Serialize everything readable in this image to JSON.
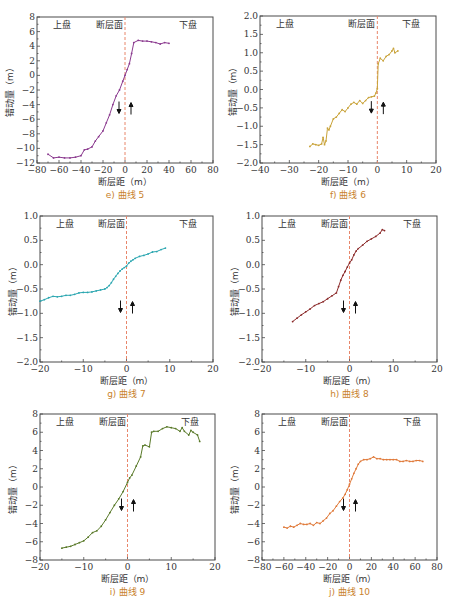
{
  "figure": {
    "x_axis_label": "断层距（m）",
    "y_axis_label": "错动量（m）",
    "region_labels": {
      "hanging_wall": "上盘",
      "fault_plane": "断层面",
      "footwall": "下盘"
    }
  },
  "chart_data": [
    {
      "id": "e",
      "type": "line",
      "title": "e) 曲线 5",
      "caption": "e) 曲线 5",
      "xlabel": "断层距（m）",
      "ylabel": "错动量（m）",
      "xlim": [
        -80,
        80
      ],
      "ylim": [
        -12,
        8
      ],
      "xticks": [
        -80,
        -60,
        -40,
        -20,
        0,
        20,
        40,
        60,
        80
      ],
      "yticks": [
        -12,
        -10,
        -8,
        -6,
        -4,
        -2,
        0,
        2,
        4,
        6,
        8
      ],
      "color": "#8b3a8f",
      "fault_line_x": 0,
      "series": [
        {
          "name": "曲线 5",
          "x": [
            -70,
            -65,
            -60,
            -55,
            -50,
            -45,
            -40,
            -37,
            -34,
            -30,
            -27,
            -24,
            -20,
            -17,
            -14,
            -11,
            -8,
            -5,
            -2,
            0,
            2,
            4,
            6,
            8,
            12,
            16,
            20,
            24,
            28,
            32,
            36,
            40
          ],
          "y": [
            -10.8,
            -11.3,
            -11.2,
            -11.3,
            -11.3,
            -11.2,
            -11.0,
            -10.2,
            -10.1,
            -9.8,
            -9.0,
            -8.4,
            -7.6,
            -6.5,
            -5.4,
            -4.0,
            -2.8,
            -2.0,
            -0.8,
            0.0,
            0.8,
            1.6,
            3.0,
            4.5,
            4.8,
            4.7,
            4.7,
            4.6,
            4.5,
            4.3,
            4.5,
            4.4
          ]
        }
      ]
    },
    {
      "id": "f",
      "type": "line",
      "title": "f) 曲线 6",
      "caption": "f) 曲线 6",
      "xlabel": "断层距（m）",
      "ylabel": "错动量（m）",
      "xlim": [
        -40,
        20
      ],
      "ylim": [
        -2.0,
        2.0
      ],
      "xticks": [
        -40,
        -30,
        -20,
        -10,
        0,
        10,
        20
      ],
      "yticks": [
        -2.0,
        -1.5,
        -1.0,
        -0.5,
        0.0,
        0.5,
        1.0,
        1.5,
        2.0
      ],
      "color": "#c9a33a",
      "fault_line_x": 0,
      "series": [
        {
          "name": "曲线 6",
          "x": [
            -23,
            -22,
            -21,
            -20,
            -19,
            -18.5,
            -18,
            -17.5,
            -17,
            -16.5,
            -16,
            -15,
            -14,
            -13,
            -12,
            -11,
            -10,
            -9,
            -8,
            -7,
            -6,
            -5,
            -4,
            -3,
            -2,
            -1,
            -0.5,
            0,
            0.3,
            1,
            2,
            3,
            4,
            5,
            5.5,
            6,
            7
          ],
          "y": [
            -1.55,
            -1.48,
            -1.5,
            -1.52,
            -1.48,
            -1.3,
            -1.5,
            -1.4,
            -1.05,
            -1.1,
            -1.0,
            -0.8,
            -0.75,
            -0.65,
            -0.55,
            -0.6,
            -0.5,
            -0.4,
            -0.35,
            -0.4,
            -0.3,
            -0.38,
            -0.3,
            -0.22,
            -0.2,
            -0.18,
            -0.1,
            0.02,
            0.7,
            0.85,
            0.78,
            0.9,
            0.95,
            1.05,
            1.12,
            1.0,
            1.05
          ]
        }
      ]
    },
    {
      "id": "g",
      "type": "line",
      "title": "g) 曲线 7",
      "caption": "g) 曲线 7",
      "xlabel": "断层距（m）",
      "ylabel": "错动量（m）",
      "xlim": [
        -20,
        20
      ],
      "ylim": [
        -2.0,
        1.0
      ],
      "xticks": [
        -20,
        -10,
        0,
        10,
        20
      ],
      "yticks": [
        -2.0,
        -1.5,
        -1.0,
        -0.5,
        0.0,
        0.5,
        1.0
      ],
      "color": "#2aa6b0",
      "fault_line_x": 0,
      "series": [
        {
          "name": "曲线 7",
          "x": [
            -20,
            -19,
            -18,
            -17,
            -16,
            -15,
            -14,
            -13,
            -12,
            -11,
            -10,
            -9,
            -8,
            -7,
            -6,
            -5,
            -4.5,
            -4,
            -3.5,
            -3,
            -2.5,
            -2,
            -1.5,
            -1,
            -0.5,
            0,
            0.5,
            1,
            1.5,
            2,
            3,
            4,
            5,
            6,
            7,
            8,
            9
          ],
          "y": [
            -0.75,
            -0.72,
            -0.68,
            -0.65,
            -0.66,
            -0.65,
            -0.63,
            -0.63,
            -0.61,
            -0.58,
            -0.57,
            -0.57,
            -0.56,
            -0.54,
            -0.52,
            -0.5,
            -0.47,
            -0.43,
            -0.37,
            -0.3,
            -0.24,
            -0.18,
            -0.13,
            -0.09,
            -0.06,
            -0.03,
            0.03,
            0.07,
            0.1,
            0.13,
            0.17,
            0.19,
            0.22,
            0.26,
            0.27,
            0.31,
            0.34
          ]
        }
      ]
    },
    {
      "id": "h",
      "type": "line",
      "title": "h) 曲线 8",
      "caption": "h) 曲线 8",
      "xlabel": "断层距（m）",
      "ylabel": "错动量（m）",
      "xlim": [
        -20,
        20
      ],
      "ylim": [
        -2.0,
        1.0
      ],
      "xticks": [
        -20,
        -10,
        0,
        10,
        20
      ],
      "yticks": [
        -2.0,
        -1.5,
        -1.0,
        -0.5,
        0.0,
        0.5,
        1.0
      ],
      "color": "#8b2a2a",
      "fault_line_x": 0,
      "series": [
        {
          "name": "曲线 8",
          "x": [
            -13,
            -12,
            -11,
            -10,
            -9,
            -8,
            -7,
            -6,
            -5,
            -4,
            -3,
            -2.5,
            -2,
            -1.5,
            -1,
            -0.5,
            0,
            0.5,
            1,
            1.5,
            2,
            3,
            4,
            5,
            6,
            7,
            7.5,
            8
          ],
          "y": [
            -1.17,
            -1.1,
            -1.03,
            -0.97,
            -0.91,
            -0.84,
            -0.8,
            -0.76,
            -0.7,
            -0.64,
            -0.58,
            -0.45,
            -0.32,
            -0.22,
            -0.14,
            -0.05,
            0.03,
            0.1,
            0.2,
            0.28,
            0.33,
            0.4,
            0.48,
            0.53,
            0.58,
            0.65,
            0.72,
            0.7
          ]
        }
      ]
    },
    {
      "id": "i",
      "type": "line",
      "title": "i) 曲线 9",
      "caption": "i) 曲线 9",
      "xlabel": "断层距（m）",
      "ylabel": "错动量（m）",
      "xlim": [
        -20,
        20
      ],
      "ylim": [
        -8,
        8
      ],
      "xticks": [
        -20,
        -10,
        0,
        10,
        20
      ],
      "yticks": [
        -8,
        -6,
        -4,
        -2,
        0,
        2,
        4,
        6,
        8
      ],
      "color": "#5a7a2a",
      "fault_line_x": 0,
      "series": [
        {
          "name": "曲线 9",
          "x": [
            -15,
            -14,
            -13,
            -12,
            -11,
            -10,
            -9,
            -8,
            -7,
            -6,
            -5,
            -4,
            -3,
            -2,
            -1,
            0,
            0.5,
            1,
            2,
            3,
            3.5,
            4,
            5,
            5.5,
            6,
            7,
            8,
            9,
            10,
            11,
            12,
            12.5,
            13,
            14,
            14.5,
            15,
            16,
            16.5
          ],
          "y": [
            -6.7,
            -6.6,
            -6.5,
            -6.3,
            -6.1,
            -5.9,
            -5.5,
            -5.0,
            -4.8,
            -4.3,
            -3.6,
            -2.8,
            -2.0,
            -1.3,
            -0.5,
            0.5,
            1.0,
            1.3,
            2.3,
            3.3,
            4.5,
            4.6,
            4.4,
            6.0,
            6.1,
            6.1,
            6.4,
            6.6,
            6.5,
            6.4,
            6.1,
            6.5,
            6.1,
            5.7,
            6.2,
            6.0,
            5.7,
            5.0
          ]
        }
      ]
    },
    {
      "id": "j",
      "type": "line",
      "title": "j) 曲线 10",
      "caption": "j) 曲线 10",
      "xlabel": "断层距（m）",
      "ylabel": "错动量（m）",
      "xlim": [
        -80,
        80
      ],
      "ylim": [
        -8,
        8
      ],
      "xticks": [
        -80,
        -60,
        -40,
        -20,
        0,
        20,
        40,
        60,
        80
      ],
      "yticks": [
        -8,
        -6,
        -4,
        -2,
        0,
        2,
        4,
        6,
        8
      ],
      "color": "#e07a3a",
      "fault_line_x": 0,
      "series": [
        {
          "name": "曲线 10",
          "x": [
            -60,
            -57,
            -54,
            -51,
            -48,
            -45,
            -42,
            -39,
            -36,
            -33,
            -30,
            -27,
            -24,
            -21,
            -18,
            -15,
            -12,
            -9,
            -6,
            -4,
            -2,
            0,
            2,
            4,
            6,
            8,
            10,
            13,
            16,
            19,
            22,
            25,
            28,
            31,
            34,
            37,
            40,
            43,
            46,
            49,
            52,
            55,
            58,
            61,
            64,
            67
          ],
          "y": [
            -4.4,
            -4.5,
            -4.3,
            -4.4,
            -4.2,
            -4.0,
            -4.1,
            -4.1,
            -4.0,
            -4.2,
            -3.9,
            -4.0,
            -3.7,
            -3.4,
            -2.9,
            -2.6,
            -2.1,
            -1.6,
            -1.2,
            -0.8,
            -0.3,
            0.3,
            0.9,
            1.5,
            2.0,
            2.5,
            2.8,
            3.0,
            3.0,
            3.1,
            3.3,
            3.1,
            3.1,
            3.0,
            3.0,
            3.0,
            3.0,
            3.0,
            2.8,
            2.8,
            2.9,
            2.8,
            2.8,
            2.9,
            2.9,
            2.8
          ]
        }
      ]
    }
  ]
}
